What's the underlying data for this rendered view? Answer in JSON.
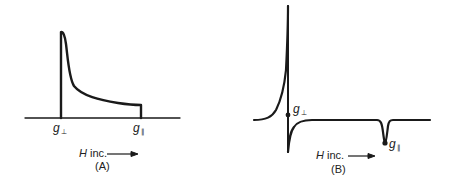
{
  "panel_a": {
    "g_perp": {
      "symbol": "g",
      "subscript": "⊥"
    },
    "g_par": {
      "symbol": "g",
      "subscript": "∥"
    },
    "axis_label_var": "H",
    "axis_label_text": " inc.",
    "panel_label": "(A)"
  },
  "panel_b": {
    "g_perp": {
      "symbol": "g",
      "subscript": "⊥"
    },
    "g_par": {
      "symbol": "g",
      "subscript": "∥"
    },
    "axis_label_var": "H",
    "axis_label_text": " inc.",
    "panel_label": "(B)"
  },
  "colors": {
    "line": "#1a1a1a",
    "background": "#ffffff"
  }
}
